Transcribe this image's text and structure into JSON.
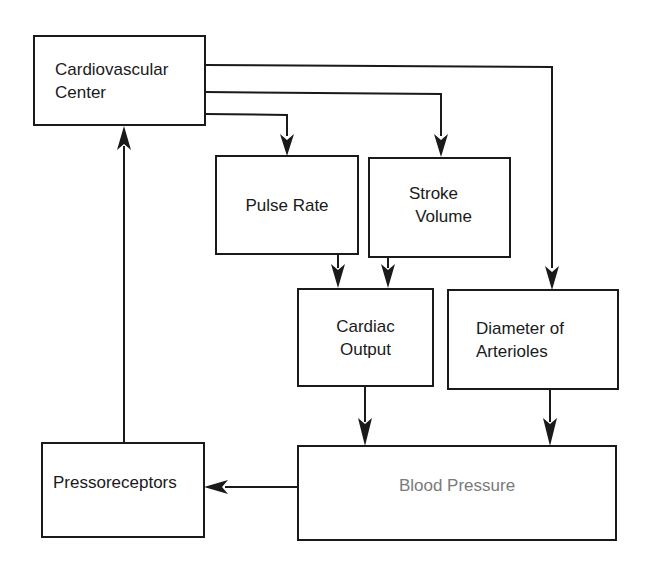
{
  "diagram": {
    "type": "flowchart",
    "nodes": [
      {
        "id": "cardiovascular_center",
        "lines": [
          "Cardiovascular",
          "Center"
        ]
      },
      {
        "id": "pulse_rate",
        "lines": [
          "Pulse Rate"
        ]
      },
      {
        "id": "stroke_volume",
        "lines": [
          "Stroke",
          "Volume"
        ]
      },
      {
        "id": "cardiac_output",
        "lines": [
          "Cardiac",
          "Output"
        ]
      },
      {
        "id": "diameter_of_arterioles",
        "lines": [
          "Diameter of",
          "Arterioles"
        ]
      },
      {
        "id": "blood_pressure",
        "lines": [
          "Blood Pressure"
        ]
      },
      {
        "id": "pressoreceptors",
        "lines": [
          "Pressoreceptors"
        ]
      }
    ],
    "edges": [
      {
        "from": "cardiovascular_center",
        "to": "pulse_rate"
      },
      {
        "from": "cardiovascular_center",
        "to": "stroke_volume"
      },
      {
        "from": "cardiovascular_center",
        "to": "diameter_of_arterioles"
      },
      {
        "from": "pulse_rate",
        "to": "cardiac_output"
      },
      {
        "from": "stroke_volume",
        "to": "cardiac_output"
      },
      {
        "from": "cardiac_output",
        "to": "blood_pressure"
      },
      {
        "from": "diameter_of_arterioles",
        "to": "blood_pressure"
      },
      {
        "from": "blood_pressure",
        "to": "pressoreceptors"
      },
      {
        "from": "pressoreceptors",
        "to": "cardiovascular_center"
      }
    ],
    "colors": {
      "stroke": "#1a1a1a",
      "text": "#1a1a1a",
      "blood_pressure_text": "#7a7a7a",
      "background": "#ffffff"
    }
  }
}
